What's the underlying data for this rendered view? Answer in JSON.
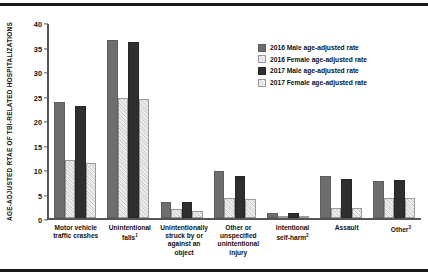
{
  "chart_data": {
    "type": "bar",
    "title": "",
    "xlabel": "",
    "ylabel": "AGE-ADJUSTED RTAE OF TBI-RELATED HOSPITALIZATIONS",
    "ylim": [
      0,
      40
    ],
    "ytick_step": 5,
    "yticks": [
      "0",
      "5",
      "10",
      "15",
      "20",
      "25",
      "30",
      "35",
      "40"
    ],
    "grid": false,
    "legend_position": "top-right",
    "categories": [
      "Motor vehicle traffic crashes",
      "Unintentional falls¹",
      "Unintentionally struck by or against an object",
      "Other or unspecified unintentional injury",
      "Intentional self-harm²",
      "Assault",
      "Other³"
    ],
    "category_lines": [
      [
        "Motor vehicle",
        "traffic crashes"
      ],
      [
        "Unintentional",
        "falls"
      ],
      [
        "Unintentionally",
        "struck by or",
        "against an",
        "object"
      ],
      [
        "Other or",
        "unspecified",
        "unintentional",
        "injury"
      ],
      [
        "Intentional",
        "self-harm"
      ],
      [
        "Assault"
      ],
      [
        "Other"
      ]
    ],
    "category_footnotes": [
      "",
      "1",
      "",
      "",
      "2",
      "",
      "3"
    ],
    "series": [
      {
        "name": "2016 Male age-adjusted rate",
        "key": "m16",
        "color": "#6e6e6e",
        "values": [
          23.9,
          36.7,
          3.4,
          9.7,
          1.1,
          8.8,
          7.6
        ]
      },
      {
        "name": "2016 Female age-adjusted rate",
        "key": "f16",
        "color": "#ececec",
        "values": [
          12.1,
          24.7,
          1.9,
          4.3,
          0.5,
          2.1,
          4.3
        ]
      },
      {
        "name": "2017 Male age-adjusted rate",
        "key": "m17",
        "color": "#2f2f2f",
        "values": [
          23.1,
          36.2,
          3.3,
          8.7,
          1.1,
          8.2,
          8.0
        ]
      },
      {
        "name": "2017 Female age-adjusted rate",
        "key": "f17",
        "color": "#ececec",
        "values": [
          11.5,
          24.5,
          1.6,
          4.0,
          0.4,
          2.1,
          4.1
        ]
      }
    ]
  },
  "legend": {
    "items": [
      {
        "label": "2016 Male age-adjusted rate",
        "key": "m16"
      },
      {
        "label": "2016 Female age-adjusted rate",
        "key": "f16"
      },
      {
        "label": "2017 Male age-adjusted rate",
        "key": "m17"
      },
      {
        "label": "2017 Female age-adjusted rate",
        "key": "f17"
      }
    ]
  }
}
